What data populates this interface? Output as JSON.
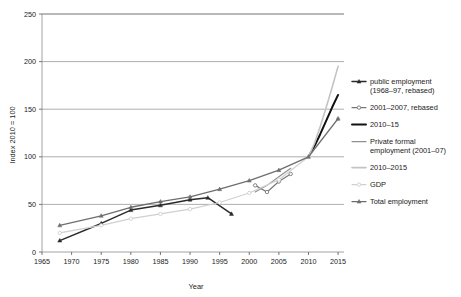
{
  "chart_data": {
    "type": "line",
    "title": "",
    "xlabel": "Year",
    "ylabel": "Index 2010 = 100",
    "xlim": [
      1965,
      2016
    ],
    "ylim": [
      0,
      250
    ],
    "xticks": [
      1965,
      1970,
      1975,
      1980,
      1985,
      1990,
      1995,
      2000,
      2005,
      2010,
      2015
    ],
    "yticks": [
      0,
      50,
      100,
      150,
      200,
      250
    ],
    "grid": "horizontal",
    "legend_position": "right-outside",
    "series": [
      {
        "name": "public employment (1968–97, rebased)",
        "color": "#2b2b2b",
        "width": 1.5,
        "marker": "triangle",
        "x": [
          1968,
          1975,
          1980,
          1985,
          1990,
          1993,
          1997
        ],
        "values": [
          12,
          30,
          44,
          49,
          55,
          57,
          40
        ]
      },
      {
        "name": "2001–2007, rebased",
        "color": "#777777",
        "width": 1.2,
        "marker": "circle",
        "x": [
          2001,
          2003,
          2005,
          2007
        ],
        "values": [
          70,
          63,
          74,
          82
        ]
      },
      {
        "name": "2010–15",
        "color": "#111111",
        "width": 2.0,
        "marker": "none",
        "x": [
          2010,
          2011,
          2012,
          2013,
          2014,
          2015
        ],
        "values": [
          100,
          111,
          124,
          138,
          152,
          165
        ]
      },
      {
        "name": "Private formal employment (2001–07)",
        "color": "#8f8f8f",
        "width": 1.1,
        "marker": "none",
        "x": [
          2001,
          2003,
          2005,
          2007
        ],
        "values": [
          63,
          70,
          79,
          88
        ]
      },
      {
        "name": "2010–2015",
        "color": "#c4c4c4",
        "width": 1.6,
        "marker": "none",
        "x": [
          2010,
          2011,
          2012,
          2013,
          2014,
          2015
        ],
        "values": [
          100,
          114,
          132,
          152,
          173,
          195
        ]
      },
      {
        "name": "GDP",
        "color": "#d0d0d0",
        "width": 1.2,
        "marker": "circle",
        "x": [
          1968,
          1975,
          1980,
          1985,
          1990,
          1995,
          2000,
          2005,
          2010,
          2015
        ],
        "values": [
          20,
          28,
          35,
          40,
          45,
          52,
          62,
          76,
          100,
          140
        ]
      },
      {
        "name": "Total employment",
        "color": "#6e6e6e",
        "width": 1.3,
        "marker": "triangle",
        "x": [
          1968,
          1975,
          1980,
          1985,
          1990,
          1995,
          2000,
          2005,
          2010,
          2015
        ],
        "values": [
          28,
          38,
          47,
          53,
          58,
          66,
          75,
          86,
          100,
          140
        ]
      }
    ]
  },
  "legend": {
    "entries": [
      {
        "label": "public employment (1968–97, rebased)",
        "series_index": 0
      },
      {
        "label": "2001–2007, rebased",
        "series_index": 1
      },
      {
        "label": "2010–15",
        "series_index": 2
      },
      {
        "label": "Private formal employment (2001–07)",
        "series_index": 3
      },
      {
        "label": "2010–2015",
        "series_index": 4
      },
      {
        "label": "GDP",
        "series_index": 5
      },
      {
        "label": "Total employment",
        "series_index": 6
      }
    ]
  },
  "colors": {
    "background": "#ffffff",
    "frame": "#8c8c8c",
    "grid": "#8c8c8c",
    "text": "#1a1a1a"
  }
}
